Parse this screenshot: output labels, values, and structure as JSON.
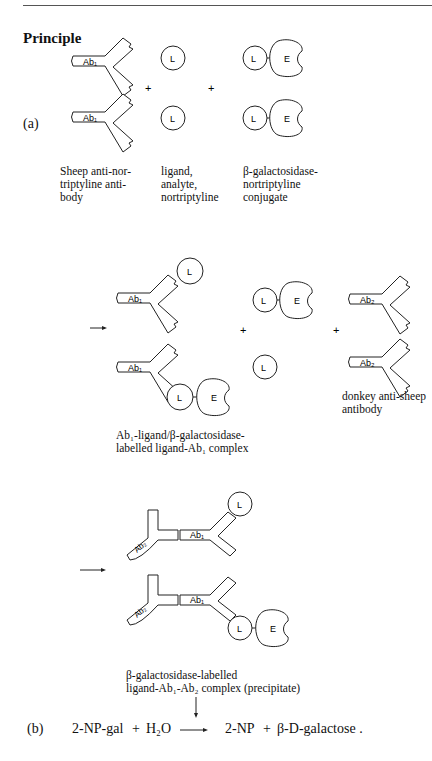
{
  "page": {
    "heading": "Principle",
    "part_a_label": "(a)",
    "part_b_label": "(b)"
  },
  "row1": {
    "antibody_label": "Ab₁",
    "ligand_label": "L",
    "enzyme_label": "E",
    "plus": "+",
    "caption_antibody": [
      "Sheep anti-nor-",
      "triptyline anti-",
      "body"
    ],
    "caption_ligand": [
      "ligand,",
      "analyte,",
      "nortriptyline"
    ],
    "caption_conjugate": [
      "β-galactosidase-",
      "nortriptyline",
      "conjugate"
    ]
  },
  "row2": {
    "ab1_label": "Ab₁",
    "ab2_label": "Ab₂",
    "ligand_label": "L",
    "enzyme_label": "E",
    "plus": "+",
    "caption_complex": [
      "Ab₁-ligand/β-galactosidase-",
      "labelled ligand-Ab₁ complex"
    ],
    "caption_ab2": [
      "donkey anti-sheep",
      "antibody"
    ]
  },
  "row3": {
    "ab1_label": "Ab₁",
    "ab2_label": "Ab₂",
    "ligand_label": "L",
    "enzyme_label": "E",
    "caption_precipitate": [
      "β-galactosidase-labelled",
      "ligand-Ab₁-Ab₂ complex (precipitate)"
    ]
  },
  "reaction": {
    "reactant_1": "2-NP-gal",
    "plus_1": "+",
    "reactant_2": "H₂O",
    "product_1": "2-NP",
    "plus_2": "+",
    "product_2": "β-D-galactose ."
  }
}
